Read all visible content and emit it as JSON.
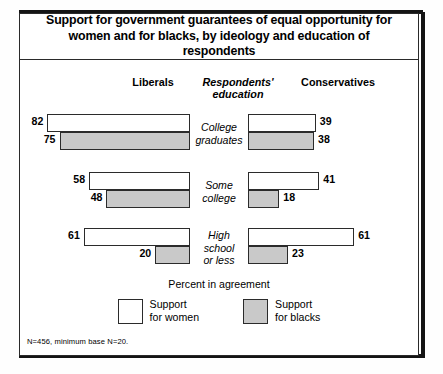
{
  "title": "Support for government guarantees of equal opportunity for women and for blacks, by ideology and education of respondents",
  "headers": {
    "left": "Liberals",
    "center_line1": "Respondents'",
    "center_line2": "education",
    "right": "Conservatives"
  },
  "axis_caption": "Percent in agreement",
  "legend": [
    {
      "swatch": "white",
      "line1": "Support",
      "line2": "for women"
    },
    {
      "swatch": "gray",
      "line1": "Support",
      "line2": "for blacks"
    }
  ],
  "footnote": "N=456, minimum base N=20.",
  "colors": {
    "women_fill": "#ffffff",
    "blacks_fill": "#c9c9c9",
    "outline": "#2b2b2b",
    "rule": "#141414"
  },
  "rows": [
    {
      "label_lines": [
        "College",
        "graduates"
      ],
      "liberals_women": 82,
      "liberals_blacks": 75,
      "conservatives_women": 39,
      "conservatives_blacks": 38
    },
    {
      "label_lines": [
        "Some",
        "college"
      ],
      "liberals_women": 58,
      "liberals_blacks": 48,
      "conservatives_women": 41,
      "conservatives_blacks": 18
    },
    {
      "label_lines": [
        "High",
        "school",
        "or less"
      ],
      "liberals_women": 61,
      "liberals_blacks": 20,
      "conservatives_women": 61,
      "conservatives_blacks": 23
    }
  ],
  "chart_data": {
    "type": "bar",
    "title": "Support for government guarantees of equal opportunity for women and for blacks, by ideology and education of respondents",
    "subtitle": "",
    "orientation": "horizontal-diverging",
    "xlabel": "Percent in agreement",
    "ylabel": "Respondents' education",
    "categories": [
      "College graduates",
      "Some college",
      "High school or less"
    ],
    "panels": [
      "Liberals",
      "Conservatives"
    ],
    "legend_position": "bottom-center",
    "grid": false,
    "xlim": [
      0,
      82
    ],
    "series": [
      {
        "name": "Support for women",
        "panel": "Liberals",
        "values": [
          82,
          58,
          61
        ]
      },
      {
        "name": "Support for blacks",
        "panel": "Liberals",
        "values": [
          75,
          48,
          20
        ]
      },
      {
        "name": "Support for women",
        "panel": "Conservatives",
        "values": [
          39,
          41,
          61
        ]
      },
      {
        "name": "Support for blacks",
        "panel": "Conservatives",
        "values": [
          38,
          18,
          23
        ]
      }
    ],
    "annotations": [
      "N=456, minimum base N=20."
    ],
    "units": "percent"
  }
}
